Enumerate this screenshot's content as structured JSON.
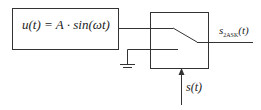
{
  "diagram": {
    "source_block": {
      "formula": "u(t) = A · sin(ωt)"
    },
    "output": {
      "symbol": "s",
      "subscript": "2ASK",
      "arg": "(t)"
    },
    "control": {
      "label": "s(t)"
    },
    "colors": {
      "line": "#333333",
      "background": "#ffffff"
    }
  }
}
